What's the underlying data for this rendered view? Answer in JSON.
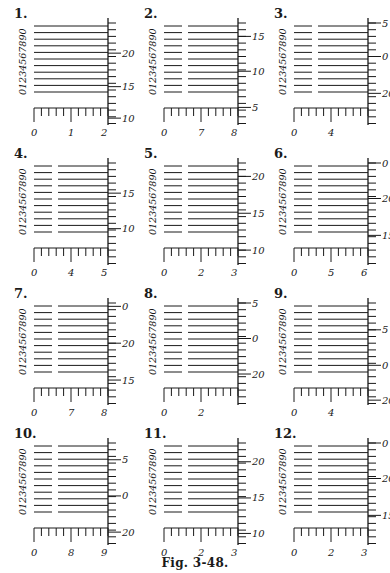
{
  "figure": {
    "caption": "Fig. 3-48.",
    "ink_color": "#1a1a1a",
    "background": "#ffffff",
    "digit_column": "0123456789 0",
    "panels": [
      {
        "num": "1.",
        "split": false,
        "bottom_labels": [
          "0",
          "1",
          "2"
        ],
        "right_labels": [
          {
            "v": "20",
            "row": 4.5
          },
          {
            "v": "15",
            "row": 9.5
          },
          {
            "v": "10",
            "row": 14.2
          }
        ]
      },
      {
        "num": "2.",
        "split": true,
        "bottom_labels": [
          "0",
          "7",
          "8"
        ],
        "right_labels": [
          {
            "v": "15",
            "row": 2
          },
          {
            "v": "10",
            "row": 7.2
          },
          {
            "v": "5",
            "row": 12.6
          }
        ]
      },
      {
        "num": "3.",
        "split": true,
        "bottom_labels": [
          "0",
          "4",
          ""
        ],
        "right_labels": [
          {
            "v": "5",
            "row": 0
          },
          {
            "v": "0",
            "row": 5
          },
          {
            "v": "20",
            "row": 10.5
          }
        ]
      },
      {
        "num": "4.",
        "split": true,
        "bottom_labels": [
          "0",
          "4",
          "5"
        ],
        "right_labels": [
          {
            "v": "15",
            "row": 4.5
          },
          {
            "v": "10",
            "row": 9.8
          }
        ]
      },
      {
        "num": "5.",
        "split": true,
        "bottom_labels": [
          "0",
          "2",
          "3"
        ],
        "right_labels": [
          {
            "v": "20",
            "row": 2
          },
          {
            "v": "15",
            "row": 7.5
          },
          {
            "v": "10",
            "row": 13
          }
        ]
      },
      {
        "num": "6.",
        "split": true,
        "bottom_labels": [
          "0",
          "5",
          "6"
        ],
        "right_labels": [
          {
            "v": "0",
            "row": 0
          },
          {
            "v": "20",
            "row": 5.3
          },
          {
            "v": "15",
            "row": 10.8
          }
        ]
      },
      {
        "num": "7.",
        "split": true,
        "bottom_labels": [
          "0",
          "7",
          "8"
        ],
        "right_labels": [
          {
            "v": "0",
            "row": 0.5
          },
          {
            "v": "20",
            "row": 6
          },
          {
            "v": "15",
            "row": 11.5
          }
        ]
      },
      {
        "num": "8.",
        "split": true,
        "bottom_labels": [
          "0",
          "2",
          ""
        ],
        "right_labels": [
          {
            "v": "5",
            "row": 0
          },
          {
            "v": "0",
            "row": 5.3
          },
          {
            "v": "20",
            "row": 10.6
          }
        ]
      },
      {
        "num": "9.",
        "split": true,
        "bottom_labels": [
          "0",
          "4",
          ""
        ],
        "right_labels": [
          {
            "v": "5",
            "row": 4
          },
          {
            "v": "0",
            "row": 9.3
          },
          {
            "v": "20",
            "row": 14.5
          }
        ]
      },
      {
        "num": "10.",
        "split": true,
        "bottom_labels": [
          "0",
          "8",
          "9"
        ],
        "right_labels": [
          {
            "v": "5",
            "row": 2.5
          },
          {
            "v": "0",
            "row": 7.9
          },
          {
            "v": "20",
            "row": 13.3
          }
        ]
      },
      {
        "num": "11.",
        "split": true,
        "bottom_labels": [
          "0",
          "2",
          "3"
        ],
        "right_labels": [
          {
            "v": "20",
            "row": 2.8
          },
          {
            "v": "15",
            "row": 8.2
          },
          {
            "v": "10",
            "row": 13.5
          }
        ]
      },
      {
        "num": "12.",
        "split": true,
        "bottom_labels": [
          "0",
          "2",
          "3"
        ],
        "right_labels": [
          {
            "v": "0",
            "row": 0
          },
          {
            "v": "20",
            "row": 5.3
          },
          {
            "v": "15",
            "row": 10.8
          }
        ]
      }
    ]
  }
}
